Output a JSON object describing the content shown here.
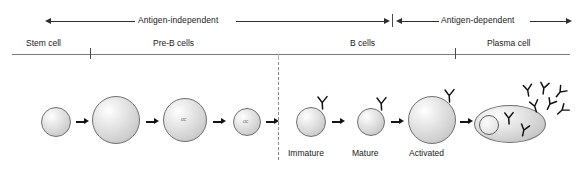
{
  "figure": {
    "width": 582,
    "height": 170,
    "background_color": "#ffffff",
    "line_color": "#2e2e2e",
    "axis_color": "#7b7b7b",
    "cell_outline_color": "#6f6f6f"
  },
  "phases": [
    {
      "id": "antigen-independent",
      "label": "Antigen-independent",
      "start_px": 45,
      "end_px": 392
    },
    {
      "id": "antigen-dependent",
      "label": "Antigen-dependent",
      "start_px": 396,
      "end_px": 572
    }
  ],
  "stages": [
    {
      "id": "stem-cell",
      "label": "Stem cell",
      "center_px": 53
    },
    {
      "id": "pre-b-cells",
      "label": "Pre-B cells",
      "center_px": 182
    },
    {
      "id": "b-cells",
      "label": "B cells",
      "center_px": 367
    },
    {
      "id": "plasma-cell",
      "label": "Plasma cell",
      "center_px": 515
    }
  ],
  "axis_ticks": [
    {
      "id": "tick-stem-preb",
      "x_px": 90,
      "style": "solid"
    },
    {
      "id": "tick-midline",
      "x_px": 278,
      "style": "faint"
    },
    {
      "id": "tick-b-plasma",
      "x_px": 455,
      "style": "solid"
    }
  ],
  "cells": [
    {
      "id": "stem-cell-body",
      "name": "stem-cell",
      "shape": "circle",
      "cx": 56,
      "cy": 122,
      "r": 15,
      "marker": "",
      "receptors": 0
    },
    {
      "id": "early-pro-b-cell",
      "name": "early-pro-b-cell",
      "shape": "circle",
      "cx": 116,
      "cy": 120,
      "r": 24,
      "marker": "",
      "receptors": 0
    },
    {
      "id": "pre-b-cell-large",
      "name": "pre-b-cell-large",
      "shape": "circle",
      "cx": 185,
      "cy": 120,
      "r": 22,
      "marker": "αc",
      "receptors": 0
    },
    {
      "id": "pre-b-cell-small",
      "name": "pre-b-cell-small",
      "shape": "circle",
      "cx": 247,
      "cy": 122,
      "r": 14,
      "marker": "αc",
      "receptors": 0
    },
    {
      "id": "immature-b-cell",
      "name": "immature-b-cell",
      "shape": "circle",
      "cx": 311,
      "cy": 122,
      "r": 15,
      "marker": "",
      "receptors": 1
    },
    {
      "id": "mature-b-cell",
      "name": "mature-b-cell",
      "shape": "circle",
      "cx": 371,
      "cy": 122,
      "r": 14,
      "marker": "",
      "receptors": 1
    },
    {
      "id": "activated-b-cell",
      "name": "activated-b-cell",
      "shape": "circle",
      "cx": 432,
      "cy": 120,
      "r": 24,
      "marker": "",
      "receptors": 1
    },
    {
      "id": "plasma-cell-body",
      "name": "plasma-cell",
      "shape": "ellipse",
      "cx": 510,
      "cy": 124,
      "rx": 36,
      "ry": 19,
      "marker": "",
      "receptors": 2
    }
  ],
  "plasma_cell": {
    "nucleus": {
      "cx": 489,
      "cy": 125,
      "r": 10
    },
    "internal_antibodies": 2,
    "secreted_antibodies": 6
  },
  "sub_labels": [
    {
      "id": "immature",
      "label": "Immature",
      "center_px": 311
    },
    {
      "id": "mature",
      "label": "Mature",
      "center_px": 371
    },
    {
      "id": "activated",
      "label": "Activated",
      "center_px": 434
    }
  ],
  "divider": {
    "id": "antigen-divider",
    "x_px": 278,
    "style": "dashed",
    "y_start": 60,
    "y_end": 160
  },
  "step_arrows": [
    {
      "id": "arrow-1",
      "from": "stem-cell",
      "to": "early-pro-b-cell",
      "x_px": 76,
      "y_px": 122
    },
    {
      "id": "arrow-2",
      "from": "early-pro-b-cell",
      "to": "pre-b-cell-large",
      "x_px": 147,
      "y_px": 122
    },
    {
      "id": "arrow-3",
      "from": "pre-b-cell-large",
      "to": "pre-b-cell-small",
      "x_px": 214,
      "y_px": 122
    },
    {
      "id": "arrow-4",
      "from": "pre-b-cell-small",
      "to": "immature-b-cell",
      "x_px": 268,
      "y_px": 122
    },
    {
      "id": "arrow-5",
      "from": "immature-b-cell",
      "to": "mature-b-cell",
      "x_px": 333,
      "y_px": 122
    },
    {
      "id": "arrow-6",
      "from": "mature-b-cell",
      "to": "activated-b-cell",
      "x_px": 392,
      "y_px": 122
    },
    {
      "id": "arrow-7",
      "from": "activated-b-cell",
      "to": "plasma-cell",
      "x_px": 461,
      "y_px": 122
    }
  ]
}
